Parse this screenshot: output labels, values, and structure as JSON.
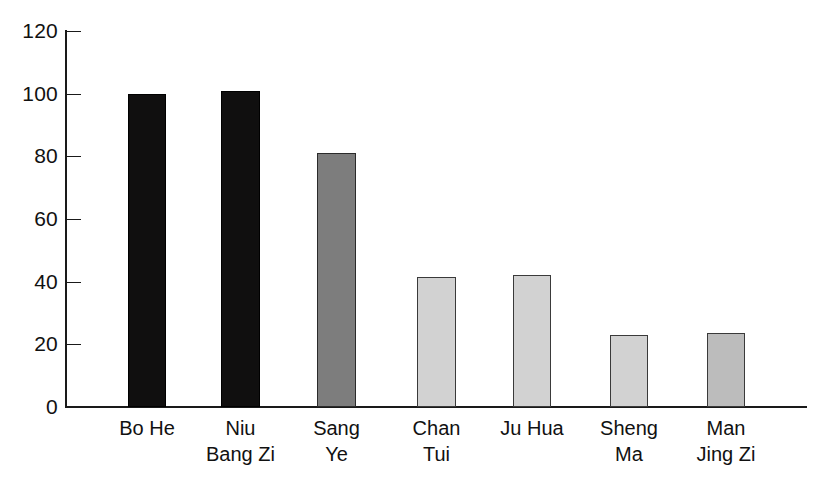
{
  "chart_data": {
    "type": "bar",
    "title": "",
    "subtitle": "",
    "xlabel": "",
    "ylabel": "",
    "ylim": [
      0,
      120
    ],
    "yticks": [
      0,
      20,
      40,
      60,
      80,
      100,
      120
    ],
    "grid": false,
    "legend": "none",
    "categories": [
      "Bo He",
      "Niu\nBang Zi",
      "Sang\nYe",
      "Chan\nTui",
      "Ju Hua",
      "Sheng\nMa",
      "Man\nJing Zi"
    ],
    "values": [
      100,
      101,
      81,
      41.5,
      42,
      23,
      23.5
    ],
    "bar_colors": [
      "#100f0f",
      "#100f0f",
      "#7d7d7d",
      "#d2d2d2",
      "#d2d2d2",
      "#d2d2d2",
      "#bcbcbc"
    ],
    "bar_shades": [
      "dark",
      "dark",
      "mid",
      "light",
      "light",
      "light",
      "lightmid"
    ]
  },
  "axis": {
    "tick_labels": [
      "120",
      "100",
      "80",
      "60",
      "40",
      "20",
      "0"
    ],
    "tick_values": [
      120,
      100,
      80,
      60,
      40,
      20,
      0
    ],
    "axis_color": "#1a1a1a"
  },
  "bars": [
    {
      "label": "Bo He",
      "label_line1": "Bo He",
      "label_line2": "",
      "value": 100,
      "shade": "dark",
      "x": 128,
      "width": 38
    },
    {
      "label": "Niu Bang Zi",
      "label_line1": "Niu",
      "label_line2": "Bang Zi",
      "value": 101,
      "shade": "dark",
      "x": 221,
      "width": 39
    },
    {
      "label": "Sang Ye",
      "label_line1": "Sang",
      "label_line2": "Ye",
      "value": 81,
      "shade": "mid",
      "x": 317,
      "width": 39
    },
    {
      "label": "Chan Tui",
      "label_line1": "Chan",
      "label_line2": "Tui",
      "value": 41.5,
      "shade": "light",
      "x": 417,
      "width": 39
    },
    {
      "label": "Ju Hua",
      "label_line1": "Ju Hua",
      "label_line2": "",
      "value": 42,
      "shade": "light",
      "x": 513,
      "width": 38
    },
    {
      "label": "Sheng Ma",
      "label_line1": "Sheng",
      "label_line2": "Ma",
      "value": 23,
      "shade": "light",
      "x": 610,
      "width": 38
    },
    {
      "label": "Man Jing Zi",
      "label_line1": "Man",
      "label_line2": "Jing Zi",
      "value": 23.5,
      "shade": "lightmid",
      "x": 707,
      "width": 38
    }
  ]
}
